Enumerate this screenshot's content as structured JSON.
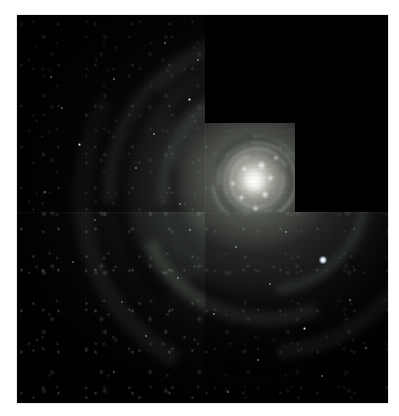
{
  "page": {
    "background_color": "#ffffff",
    "width": 399,
    "height": 416
  },
  "image": {
    "alt_text": "Hubble Space Telescope WFPC2 mosaic of a face-on spiral galaxy",
    "subject": "spiral galaxy",
    "instrument_footprint": "stair-step chevron",
    "frame": {
      "x": 17,
      "y": 15,
      "width": 371,
      "height": 388
    },
    "background_color": "#000000",
    "palette": {
      "no_data_black": "#000000",
      "core_white": "#ffffff",
      "bulge_gray": "#d6d8d0",
      "disk_gray_green": "#3a3e3a",
      "dust_lane_dark": "#0d0f0e",
      "star_knot_blue_white": "#e8eef6",
      "page_white": "#ffffff"
    },
    "regions": [
      {
        "name": "no-data-upper-right",
        "label": "Black no-data corner (upper right)",
        "x": 188,
        "y": 0,
        "width": 183,
        "height": 108
      },
      {
        "name": "no-data-right",
        "label": "Black no-data strip (right of planetary camera)",
        "x": 278,
        "y": 108,
        "width": 93,
        "height": 89
      },
      {
        "name": "chip-wf2",
        "label": "Wide Field chip (left column)",
        "x": 0,
        "y": 0,
        "width": 188,
        "height": 388
      },
      {
        "name": "chip-pc",
        "label": "Planetary Camera chip (bright nucleus)",
        "x": 188,
        "y": 108,
        "width": 90,
        "height": 89
      },
      {
        "name": "chip-wf4",
        "label": "Wide Field chip (bottom band)",
        "x": 0,
        "y": 197,
        "width": 371,
        "height": 191
      }
    ],
    "features": {
      "nucleus": {
        "label": "Galaxy nucleus",
        "x": 236,
        "y": 163
      },
      "bright_field_star": {
        "label": "Bright foreground star",
        "x": 306,
        "y": 245
      },
      "spiral_arms_visible": "two grand-design arms sweeping counter-clockwise",
      "dust_lanes_visible": "dark dust lanes threading the inner and outer disk"
    }
  }
}
